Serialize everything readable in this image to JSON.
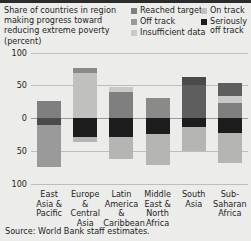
{
  "title": "Share of countries in region making progress toward reducing extreme poverty (percent)",
  "source": "Source: World Bank staff estimates.",
  "legend": {
    "column_left": [
      {
        "label": "Reached target",
        "color": "#7f7f7f",
        "key": "reached_target"
      },
      {
        "label": "Off track",
        "color": "#9a9a9a",
        "key": "off_track"
      },
      {
        "label": "Insufficient data",
        "color": "#c9c9c7",
        "key": "insufficient_data"
      }
    ],
    "column_right": [
      {
        "label": "On track",
        "color": "#c0c0be",
        "key": "on_track"
      },
      {
        "label": "Seriously off track",
        "color": "#1d1d1d",
        "key": "seriously_off_track"
      }
    ]
  },
  "chart_data": {
    "type": "bar",
    "variant": "diverging-stacked",
    "title": "Share of countries in region making progress toward reducing extreme poverty (percent)",
    "xlabel": "",
    "ylabel": "",
    "ylim": [
      -100,
      100
    ],
    "yticks": [
      100,
      50,
      0,
      50,
      100
    ],
    "ytick_labels": [
      "100",
      "50",
      "0",
      "50",
      "100"
    ],
    "grid": true,
    "legend_position": "top-right",
    "categories": [
      "East Asia & Pacific",
      "Europe & Central Asia",
      "Latin America & Caribbean",
      "Middle East & North Africa",
      "South Asia",
      "Sub-Saharan Africa"
    ],
    "series": [
      {
        "name": "Reached target",
        "color": "#7f7f7f",
        "direction": "up",
        "values": [
          26,
          0,
          40,
          30,
          13,
          23
        ]
      },
      {
        "name": "On track",
        "color": "#c0c0be",
        "direction": "up",
        "values": [
          0,
          69,
          8,
          0,
          0,
          10
        ]
      },
      {
        "name": "Insufficient data",
        "color": "#c9c9c7",
        "direction": "up",
        "values": [
          0,
          8,
          0,
          0,
          0,
          0
        ]
      },
      {
        "name": "Seriously off track",
        "color": "#1d1d1d",
        "direction": "down",
        "values": [
          10,
          29,
          29,
          25,
          13,
          23
        ]
      },
      {
        "name": "Off track",
        "color": "#9a9a9a",
        "direction": "down",
        "values": [
          65,
          0,
          33,
          46,
          38,
          46
        ]
      },
      {
        "name": "Seriously off track (upper)",
        "color": "#4a4a4a",
        "direction": "up",
        "values": [
          0,
          0,
          0,
          0,
          50,
          0
        ]
      }
    ],
    "bars": [
      {
        "category": "East Asia & Pacific",
        "up": [
          {
            "key": "reached_target",
            "value": 26,
            "color": "#7f7f7f"
          }
        ],
        "down": [
          {
            "key": "seriously_off_track",
            "value": 10,
            "color": "#4a4a4a"
          },
          {
            "key": "off_track",
            "value": 65,
            "color": "#9a9a9a"
          }
        ]
      },
      {
        "category": "Europe & Central Asia",
        "up": [
          {
            "key": "on_track",
            "value": 69,
            "color": "#c0c0be"
          },
          {
            "key": "insufficient_data",
            "value": 8,
            "color": "#8a8a88"
          }
        ],
        "down": [
          {
            "key": "seriously_off_track",
            "value": 29,
            "color": "#1d1d1d"
          },
          {
            "key": "off_track",
            "value": 8,
            "color": "#b5b5b3"
          }
        ]
      },
      {
        "category": "Latin America & Caribbean",
        "up": [
          {
            "key": "reached_target",
            "value": 40,
            "color": "#7f7f7f"
          },
          {
            "key": "on_track",
            "value": 8,
            "color": "#c9c9c7"
          }
        ],
        "down": [
          {
            "key": "seriously_off_track",
            "value": 29,
            "color": "#1d1d1d"
          },
          {
            "key": "off_track",
            "value": 33,
            "color": "#b5b5b3"
          }
        ]
      },
      {
        "category": "Middle East & North Africa",
        "up": [
          {
            "key": "reached_target",
            "value": 30,
            "color": "#8a8a88"
          }
        ],
        "down": [
          {
            "key": "seriously_off_track",
            "value": 25,
            "color": "#1d1d1d"
          },
          {
            "key": "off_track",
            "value": 46,
            "color": "#b5b5b3"
          }
        ]
      },
      {
        "category": "South Asia",
        "up": [
          {
            "key": "on_track",
            "value": 50,
            "color": "#5e5e5e"
          },
          {
            "key": "reached_target",
            "value": 13,
            "color": "#4a4a4a"
          }
        ],
        "down": [
          {
            "key": "seriously_off_track",
            "value": 13,
            "color": "#1d1d1d"
          },
          {
            "key": "off_track",
            "value": 38,
            "color": "#b5b5b3"
          }
        ]
      },
      {
        "category": "Sub-Saharan Africa",
        "up": [
          {
            "key": "reached_target",
            "value": 23,
            "color": "#7f7f7f"
          },
          {
            "key": "on_track",
            "value": 10,
            "color": "#c9c9c7"
          },
          {
            "key": "insufficient_data",
            "value": 21,
            "color": "#5e5e5e"
          }
        ],
        "down": [
          {
            "key": "seriously_off_track",
            "value": 23,
            "color": "#1d1d1d"
          },
          {
            "key": "off_track",
            "value": 46,
            "color": "#b5b5b3"
          }
        ]
      }
    ]
  },
  "axis": {
    "x_labels": [
      "East Asia & Pacific",
      "Europe & Central Asia",
      "Latin America & Caribbean",
      "Middle East & North Africa",
      "South Asia",
      "Sub-Saharan Africa"
    ]
  }
}
